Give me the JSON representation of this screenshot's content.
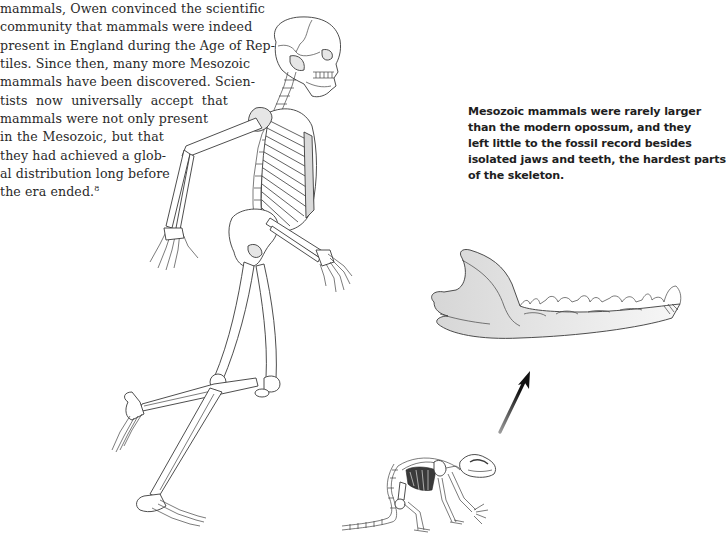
{
  "page": {
    "body_text_lines": [
      "mammals, Owen convinced the scientific",
      "community that mammals were indeed",
      "present in England during the Age of Rep-",
      "tiles. Since then, many more Mesozoic",
      "mammals have been discovered. Scien-",
      "tists now universally accept that",
      "mammals were not only present",
      "in the Mesozoic, but that",
      "they had achieved a glob-",
      "al distribution long before",
      "the era ended."
    ],
    "footnote_ref": "8",
    "caption_lines": [
      "Mesozoic mammals were rarely larger",
      "than the modern opossum, and they",
      "left little to the fossil record besides",
      "isolated jaws and teeth, the hardest parts",
      "of the skeleton."
    ],
    "illustrations": {
      "human_skeleton": "running-human-skeleton",
      "jaw": "mesozoic-mammal-jaw",
      "arrow": "up-arrow",
      "small_mammal": "small-mammal-skeleton"
    }
  }
}
